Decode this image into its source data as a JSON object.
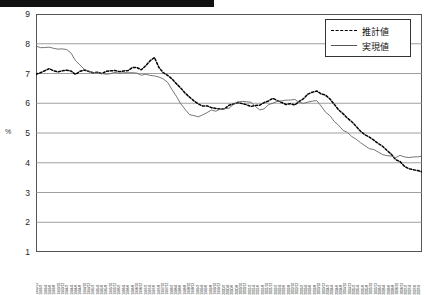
{
  "banner": {
    "present": true
  },
  "axis": {
    "unit_label": "%",
    "y_ticks": [
      9,
      8,
      7,
      6,
      5,
      4,
      3,
      2,
      1
    ]
  },
  "legend": {
    "items": [
      {
        "label": "推計値",
        "style": "dashed",
        "color": "#000000"
      },
      {
        "label": "実現値",
        "style": "solid",
        "color": "#555555"
      }
    ]
  },
  "chart_data": {
    "type": "line",
    "title": "",
    "xlabel": "",
    "ylabel": "%",
    "ylim": [
      1,
      9
    ],
    "grid": true,
    "legend_position": "top-right",
    "x": [
      "1992/12",
      "1993/3",
      "1993/6",
      "1993/9",
      "1993/12",
      "1994/3",
      "1994/6",
      "1994/9",
      "1994/12",
      "1995/3",
      "1995/6",
      "1995/9",
      "1995/12",
      "1996/3",
      "1996/6",
      "1996/9",
      "1996/12",
      "1997/3",
      "1997/6",
      "1997/9",
      "1997/12",
      "1998/3",
      "1998/6",
      "1998/9",
      "1998/12",
      "1999/3",
      "1999/6",
      "1999/9",
      "1999/12",
      "2000/3",
      "2000/6",
      "2000/9",
      "2000/12",
      "2001/3",
      "2001/6",
      "2001/9",
      "2001/12",
      "2002/3",
      "2002/6",
      "2002/9",
      "2002/12",
      "2003/3",
      "2003/6",
      "2003/9",
      "2003/12",
      "2004/3",
      "2004/6",
      "2004/9",
      "2004/12",
      "2005/3",
      "2005/6",
      "2005/9",
      "2005/12",
      "2006/3",
      "2006/6",
      "2006/9",
      "2006/12",
      "2007/3",
      "2007/6",
      "2007/9"
    ],
    "series": [
      {
        "name": "推計値",
        "style": "dashed",
        "values": [
          6.95,
          7.1,
          7.15,
          7.05,
          7.12,
          7.08,
          7.0,
          7.1,
          7.05,
          7.02,
          7.0,
          7.05,
          7.1,
          7.05,
          7.12,
          7.2,
          7.15,
          7.25,
          7.6,
          7.1,
          6.95,
          6.8,
          6.55,
          6.3,
          6.1,
          5.95,
          5.9,
          5.85,
          5.8,
          5.85,
          5.95,
          6.0,
          5.95,
          5.9,
          5.95,
          6.05,
          6.15,
          6.1,
          6.0,
          5.95,
          6.0,
          6.2,
          6.35,
          6.4,
          6.3,
          6.1,
          5.85,
          5.6,
          5.4,
          5.2,
          5.0,
          4.85,
          4.7,
          4.55,
          4.35,
          4.1,
          3.95,
          3.8,
          3.7,
          3.72
        ]
      },
      {
        "name": "実現値",
        "style": "solid",
        "values": [
          7.9,
          7.88,
          7.85,
          7.85,
          7.82,
          7.8,
          7.45,
          7.2,
          7.1,
          7.05,
          7.0,
          7.0,
          7.02,
          7.0,
          7.0,
          7.0,
          6.98,
          6.95,
          6.9,
          6.85,
          6.75,
          6.4,
          6.0,
          5.7,
          5.6,
          5.5,
          5.7,
          5.75,
          5.78,
          5.8,
          5.9,
          6.05,
          6.08,
          6.05,
          5.8,
          5.85,
          6.0,
          6.05,
          6.1,
          6.15,
          6.05,
          5.95,
          6.05,
          6.1,
          5.8,
          5.55,
          5.3,
          5.1,
          4.95,
          4.8,
          4.65,
          4.5,
          4.4,
          4.3,
          4.25,
          4.2,
          4.22,
          4.2,
          4.18,
          4.25
        ]
      }
    ]
  },
  "x_tick_labels": [
    "1992/12",
    "1993/2",
    "1993/4",
    "1993/6",
    "1993/8",
    "1993/10",
    "1993/12",
    "1994/2",
    "1994/4",
    "1994/6",
    "1994/8",
    "1994/10",
    "1994/12",
    "1995/2",
    "1995/4",
    "1995/6",
    "1995/8",
    "1995/10",
    "1995/12",
    "1996/2",
    "1996/4",
    "1996/6",
    "1996/8",
    "1996/10",
    "1996/12",
    "1997/2",
    "1997/4",
    "1997/6",
    "1997/8",
    "1997/10",
    "1997/12",
    "1998/2",
    "1998/4",
    "1998/6",
    "1998/8",
    "1998/10",
    "1998/12",
    "1999/2",
    "1999/4",
    "1999/6",
    "1999/8",
    "1999/10",
    "1999/12",
    "2000/2",
    "2000/4",
    "2000/6",
    "2000/8",
    "2000/10",
    "2000/12",
    "2001/2",
    "2001/4",
    "2001/6",
    "2001/8",
    "2001/10",
    "2001/12",
    "2002/2",
    "2002/4",
    "2002/6",
    "2002/8",
    "2002/10",
    "2002/12",
    "2003/2",
    "2003/4",
    "2003/6",
    "2003/8",
    "2003/10",
    "2003/12",
    "2004/2",
    "2004/4",
    "2004/6",
    "2004/8",
    "2004/10",
    "2004/12",
    "2005/2",
    "2005/4",
    "2005/6",
    "2005/8",
    "2005/10",
    "2005/12",
    "2006/2",
    "2006/4",
    "2006/6",
    "2006/8",
    "2006/10",
    "2006/12",
    "2007/2",
    "2007/4",
    "2007/6",
    "2007/9"
  ]
}
